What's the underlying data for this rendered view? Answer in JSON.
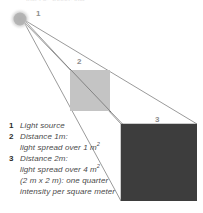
{
  "figure": {
    "title_clipped": "Inverse square law",
    "background_color": "#ffffff",
    "ray_color": "#6f6f6f",
    "callouts": [
      {
        "id": "1",
        "label": "1"
      },
      {
        "id": "2",
        "label": "2"
      },
      {
        "id": "3",
        "label": "3"
      }
    ],
    "light_source": {
      "name": "light-source",
      "color": "#b4b4b4",
      "cx": 20,
      "cy": 19,
      "r": 9
    },
    "panels": [
      {
        "name": "near-panel",
        "label": "2",
        "color": "#c4c4c4",
        "x": 70,
        "y": 70,
        "w": 40,
        "h": 41,
        "area_m2": 1
      },
      {
        "name": "far-panel",
        "label": "3",
        "color": "#3d3d3d",
        "x": 121,
        "y": 124,
        "w": 76,
        "h": 77,
        "area_m2": 4
      }
    ]
  },
  "legend": {
    "rows": [
      {
        "num": "1",
        "text": "Light source"
      },
      {
        "num": "2",
        "text": "Distance 1m:"
      },
      {
        "num": "",
        "text": "light spread over 1 m",
        "sup": "2"
      },
      {
        "num": "3",
        "text": "Distance 2m:"
      },
      {
        "num": "",
        "text": "light spread over 4 m",
        "sup": "2"
      },
      {
        "num": "",
        "text": "(2 m x 2 m): one quarter"
      },
      {
        "num": "",
        "text": "intensity per square meter"
      }
    ]
  }
}
